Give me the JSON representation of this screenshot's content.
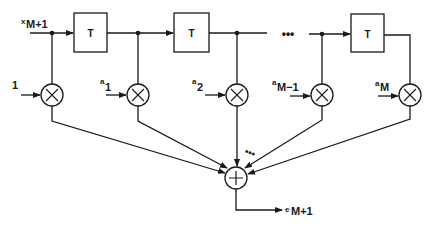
{
  "diagram": {
    "type": "FIR filter / tapped delay line (transversal filter)",
    "input": {
      "prefix": "x",
      "subscript": "M+1"
    },
    "output": {
      "prefix": "e",
      "subscript": "M+1"
    },
    "delay_label": "T",
    "delay_blocks": 3,
    "ellipsis_main": "•••",
    "ellipsis_sum": "•••",
    "multiplier_symbol": "×",
    "summer_symbol": "+",
    "coefficients": [
      {
        "prefix": "",
        "subscript": "",
        "plain": "1"
      },
      {
        "prefix": "a",
        "subscript": "1"
      },
      {
        "prefix": "a",
        "subscript": "2"
      },
      {
        "prefix": "a",
        "subscript": "M−1"
      },
      {
        "prefix": "a",
        "subscript": "M"
      }
    ],
    "colors": {
      "line": "#1a1a1a",
      "background": "#ffffff"
    }
  }
}
